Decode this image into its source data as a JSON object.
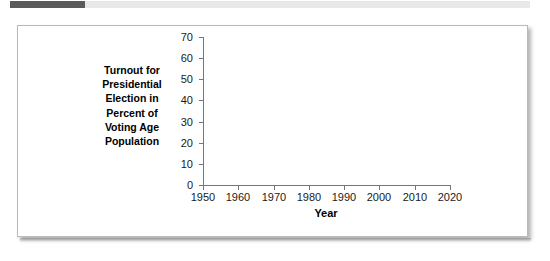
{
  "top_bar": {
    "name": "progress-bar",
    "fill_color": "#5a5a5a",
    "track_color": "#e8e8e8",
    "fill_percent": 14
  },
  "figure": {
    "border_color": "#b9b9b9",
    "background": "#ffffff"
  },
  "chart_data": {
    "type": "line",
    "title": "",
    "subtitle": "",
    "xlabel": "Year",
    "ylabel": "Turnout for Presidential Election in Percent of Voting Age Population",
    "ylabel_lines": [
      "Turnout for",
      "Presidential",
      "Election in",
      "Percent of",
      "Voting Age",
      "Population"
    ],
    "xlim": [
      1950,
      2020
    ],
    "ylim": [
      0,
      70
    ],
    "xticks": [
      1950,
      1960,
      1970,
      1980,
      1990,
      2000,
      2010,
      2020
    ],
    "xtick_labels": [
      "1950",
      "1960",
      "1970",
      "1980",
      "1990",
      "2000",
      "2010",
      "2020"
    ],
    "yticks": [
      0,
      10,
      20,
      30,
      40,
      50,
      60,
      70
    ],
    "ytick_labels": [
      "0",
      "10",
      "20",
      "30",
      "40",
      "50",
      "60",
      "70"
    ],
    "grid": false,
    "legend": null,
    "series": [],
    "x": [],
    "values": [],
    "annotations": [],
    "axis_color": "#767676",
    "note": "Empty plot template: axes drawn with no data series plotted."
  }
}
